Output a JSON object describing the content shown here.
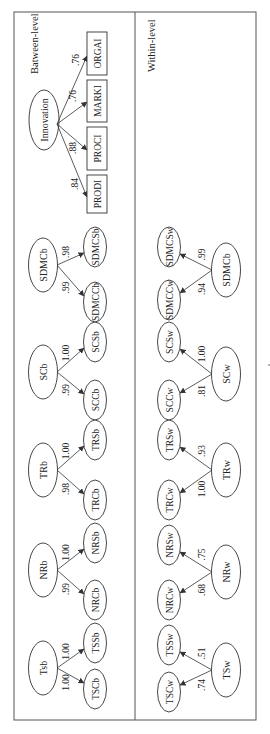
{
  "panels": {
    "between": {
      "label": "Batween-level"
    },
    "within": {
      "label": "Within-level"
    }
  },
  "innovation": {
    "latent": "Innovation",
    "indicators": [
      {
        "label": "ORGAI",
        "loading": ".76"
      },
      {
        "label": "MARKI",
        "loading": ".76"
      },
      {
        "label": "PROCI",
        "loading": ".88"
      },
      {
        "label": "PRODI",
        "loading": ".84"
      }
    ]
  },
  "between_factors": [
    {
      "latent": "SDMCb",
      "top": {
        "label": "SDMCSb",
        "loading": ".98"
      },
      "bottom": {
        "label": "SDMCCb",
        "loading": ".99"
      }
    },
    {
      "latent": "SCb",
      "top": {
        "label": "SCSb",
        "loading": "1.00"
      },
      "bottom": {
        "label": "SCCb",
        "loading": ".99"
      }
    },
    {
      "latent": "TRb",
      "top": {
        "label": "TRSb",
        "loading": "1.00"
      },
      "bottom": {
        "label": "TRCb",
        "loading": ".98"
      }
    },
    {
      "latent": "NRb",
      "top": {
        "label": "NRSb",
        "loading": "1.00"
      },
      "bottom": {
        "label": "NRCb",
        "loading": ".99"
      }
    },
    {
      "latent": "Tsb",
      "top": {
        "label": "TSSb",
        "loading": "1.00"
      },
      "bottom": {
        "label": "TSCb",
        "loading": "1.00"
      }
    }
  ],
  "within_factors": [
    {
      "latent": "SDMCb",
      "top": {
        "label": "SDMCSw",
        "loading": ".99"
      },
      "bottom": {
        "label": "SDMCCw",
        "loading": ".94"
      }
    },
    {
      "latent": "SCw",
      "top": {
        "label": "SCSw",
        "loading": "1.00"
      },
      "bottom": {
        "label": "SCCw",
        "loading": ".81"
      }
    },
    {
      "latent": "TRw",
      "top": {
        "label": "TRSw",
        "loading": ".93"
      },
      "bottom": {
        "label": "TRCw",
        "loading": "1.00"
      }
    },
    {
      "latent": "NRw",
      "top": {
        "label": "NRSw",
        "loading": ".75"
      },
      "bottom": {
        "label": "NRCw",
        "loading": ".68"
      }
    },
    {
      "latent": "TSw",
      "top": {
        "label": "TSSw",
        "loading": ".51"
      },
      "bottom": {
        "label": "TSCw",
        "loading": ".74"
      }
    }
  ],
  "colors": {
    "stroke": "#333333",
    "frame": "#555555",
    "background": "#ffffff"
  }
}
